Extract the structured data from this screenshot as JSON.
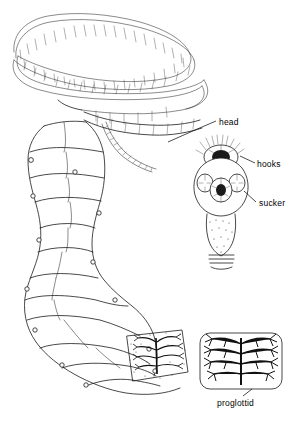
{
  "figure": {
    "background_color": "#ffffff",
    "ink_color": "#1a1a1a"
  },
  "labels": [
    {
      "id": "head",
      "text": "head"
    },
    {
      "id": "hooks",
      "text": "hooks"
    },
    {
      "id": "sucker",
      "text": "sucker"
    },
    {
      "id": "proglottid",
      "text": "proglottid"
    }
  ],
  "parts": {
    "strobila": "segmented tapeworm body chain",
    "scolex": "enlarged head with crown of hooks and four suckers",
    "proglottid_inset_small": "cut-away proglottid showing branched uterus",
    "proglottid_inset_large": "enlarged proglottid showing branched uterus"
  }
}
